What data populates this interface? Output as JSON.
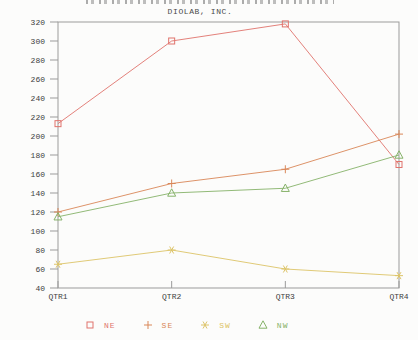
{
  "window": {
    "width": 418,
    "height": 340,
    "background": "#fcfcfb"
  },
  "chart_data": {
    "type": "line",
    "title": "DIOLAB, INC.",
    "categories": [
      "QTR1",
      "QTR2",
      "QTR3",
      "QTR4"
    ],
    "xlabel": "",
    "ylabel": "",
    "ylim": [
      40,
      320
    ],
    "y_ticks": [
      320,
      300,
      280,
      260,
      240,
      220,
      200,
      180,
      160,
      140,
      120,
      100,
      80,
      60,
      40
    ],
    "grid": false,
    "legend_position": "bottom",
    "axis_color": "#9b9b9b",
    "text_color": "#3e3e3e",
    "series": [
      {
        "name": "NE",
        "marker": "square",
        "color": "#e0736c",
        "values": [
          213,
          300,
          318,
          170
        ]
      },
      {
        "name": "SE",
        "marker": "plus",
        "color": "#d98758",
        "values": [
          120,
          150,
          165,
          202
        ]
      },
      {
        "name": "SW",
        "marker": "star",
        "color": "#ddc468",
        "values": [
          65,
          80,
          60,
          53
        ]
      },
      {
        "name": "NW",
        "marker": "triangle",
        "color": "#86b269",
        "values": [
          115,
          140,
          145,
          180
        ]
      }
    ]
  }
}
